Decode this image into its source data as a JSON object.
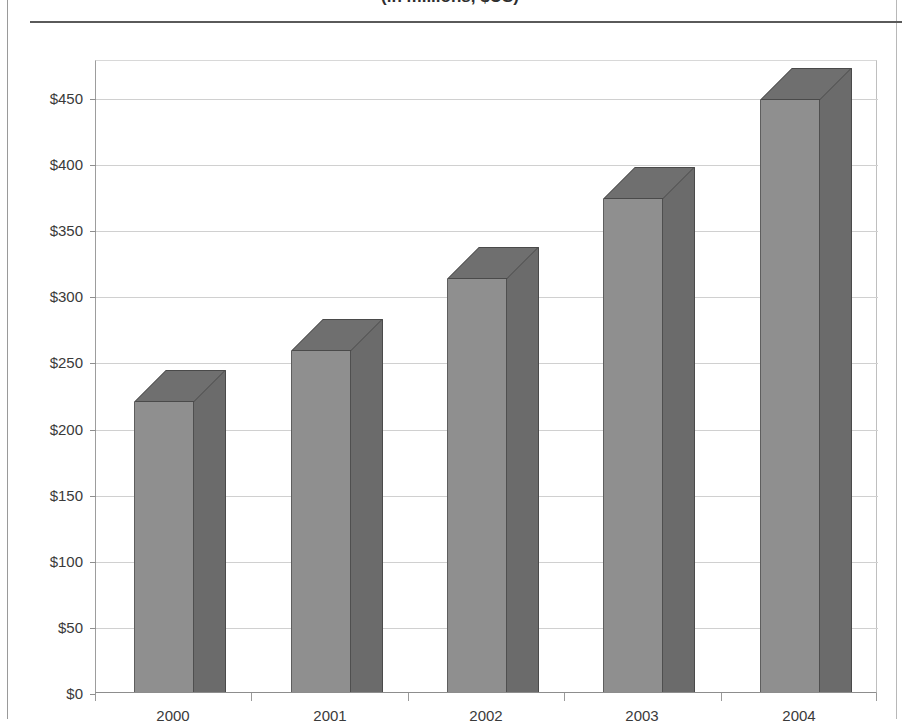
{
  "figure": {
    "title_clipped": "(in millions, $US)",
    "title_visible": false
  },
  "chart_data": {
    "type": "bar",
    "title": "(in millions, $US)",
    "xlabel": "",
    "ylabel": "",
    "categories": [
      "2000",
      "2001",
      "2002",
      "2003",
      "2004"
    ],
    "values": [
      219,
      258,
      312,
      373,
      448
    ],
    "ylim": [
      0,
      450
    ],
    "ytick_values": [
      0,
      50,
      100,
      150,
      200,
      250,
      300,
      350,
      400,
      450
    ],
    "ytick_labels": [
      "$0",
      "$50",
      "$100",
      "$150",
      "$200",
      "$250",
      "$300",
      "$350",
      "$400",
      "$450"
    ],
    "grid": true,
    "legend": null,
    "style": "3d-column",
    "colors": {
      "bar_front": "#8f8f8f",
      "bar_side": "#6b6b6b",
      "bar_top": "#6f6f6f",
      "bar_edge": "#4a4a4a",
      "gridline": "#d0d0d0",
      "axis": "#8d8d8d",
      "text": "#3a3a3a"
    }
  }
}
